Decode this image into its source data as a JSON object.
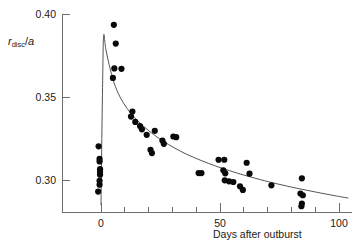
{
  "chart_data": {
    "type": "scatter",
    "title": "",
    "xlabel": "Days after outburst",
    "ylabel_parts": {
      "symbol": "r",
      "subscript": "disc",
      "divider": "/",
      "denominator": "a"
    },
    "ylabel_plain": "r_disc /a",
    "xlim": [
      -12,
      104
    ],
    "ylim": [
      0.281,
      0.402
    ],
    "grid": false,
    "legend": null,
    "x_ticks_major": [
      0,
      50,
      100
    ],
    "x_ticks_all": [
      0,
      10,
      20,
      30,
      40,
      50,
      60,
      70,
      80,
      90,
      100
    ],
    "x_tick_labels": [
      "0",
      "50",
      "100"
    ],
    "y_ticks": [
      0.3,
      0.35,
      0.4
    ],
    "y_tick_labels": [
      "0.30",
      "0.35",
      "0.40"
    ],
    "points": [
      [
        -1.0,
        0.3203
      ],
      [
        -0.6,
        0.3128
      ],
      [
        -0.6,
        0.3112
      ],
      [
        -0.4,
        0.3065
      ],
      [
        -0.4,
        0.3048
      ],
      [
        -0.4,
        0.3032
      ],
      [
        -0.6,
        0.2995
      ],
      [
        -0.6,
        0.2972
      ],
      [
        -1.2,
        0.293
      ],
      [
        5.4,
        0.3935
      ],
      [
        6.2,
        0.3822
      ],
      [
        5.6,
        0.3672
      ],
      [
        8.6,
        0.367
      ],
      [
        5.0,
        0.3615
      ],
      [
        13.2,
        0.3412
      ],
      [
        12.6,
        0.3382
      ],
      [
        14.4,
        0.335
      ],
      [
        16.4,
        0.3325
      ],
      [
        17.2,
        0.3305
      ],
      [
        19.2,
        0.3272
      ],
      [
        22.6,
        0.3296
      ],
      [
        20.8,
        0.3182
      ],
      [
        21.4,
        0.3162
      ],
      [
        25.8,
        0.3238
      ],
      [
        26.4,
        0.3218
      ],
      [
        30.4,
        0.3262
      ],
      [
        31.6,
        0.3258
      ],
      [
        41.0,
        0.3042
      ],
      [
        42.2,
        0.3042
      ],
      [
        49.4,
        0.3122
      ],
      [
        51.8,
        0.3122
      ],
      [
        51.4,
        0.3058
      ],
      [
        52.2,
        0.304
      ],
      [
        52.0,
        0.2998
      ],
      [
        53.8,
        0.2992
      ],
      [
        55.6,
        0.2988
      ],
      [
        58.4,
        0.2962
      ],
      [
        59.6,
        0.294
      ],
      [
        61.2,
        0.3104
      ],
      [
        62.4,
        0.3038
      ],
      [
        71.6,
        0.2968
      ],
      [
        84.4,
        0.301
      ],
      [
        83.8,
        0.2918
      ],
      [
        84.8,
        0.2908
      ],
      [
        84.4,
        0.2858
      ],
      [
        84.2,
        0.2842
      ]
    ],
    "fit_curve": {
      "description": "sharp rise at day 0 to peak then decaying curve",
      "points": [
        [
          0.0,
          0.2848
        ],
        [
          0.3,
          0.32
        ],
        [
          0.7,
          0.36
        ],
        [
          1.1,
          0.387
        ],
        [
          2.0,
          0.379
        ],
        [
          3.5,
          0.369
        ],
        [
          5.5,
          0.3585
        ],
        [
          8.0,
          0.35
        ],
        [
          11.0,
          0.343
        ],
        [
          14.0,
          0.3378
        ],
        [
          18.0,
          0.3322
        ],
        [
          22.0,
          0.3275
        ],
        [
          26.0,
          0.3235
        ],
        [
          31.0,
          0.3192
        ],
        [
          36.0,
          0.3155
        ],
        [
          42.0,
          0.3118
        ],
        [
          48.0,
          0.3085
        ],
        [
          54.0,
          0.3056
        ],
        [
          60.0,
          0.303
        ],
        [
          67.0,
          0.3002
        ],
        [
          74.0,
          0.2977
        ],
        [
          82.0,
          0.2951
        ],
        [
          90.0,
          0.2928
        ],
        [
          98.0,
          0.2906
        ],
        [
          104.0,
          0.2891
        ]
      ]
    }
  },
  "geometry": {
    "plot_left": 62,
    "plot_right": 352,
    "plot_top": 14,
    "plot_bottom": 212,
    "x0_px": 101,
    "x50_px": 220,
    "x100_px": 339,
    "y030_px": 180,
    "y035_px": 97,
    "y040_px": 14,
    "point_radius": 3.1
  }
}
